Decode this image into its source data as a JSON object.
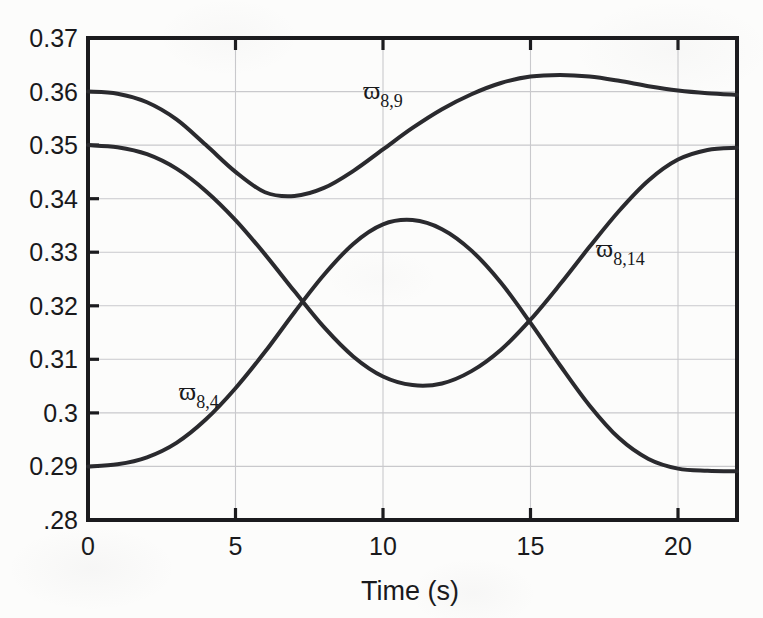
{
  "chart_data": {
    "type": "line",
    "title": "",
    "xlabel": "Time (s)",
    "ylabel": "",
    "xlim": [
      0,
      22
    ],
    "ylim": [
      0.28,
      0.37
    ],
    "grid": true,
    "legend_position": "inline-annotations",
    "x_ticks": [
      0,
      5,
      10,
      15,
      20
    ],
    "x_tick_labels": [
      "0",
      "5",
      "10",
      "15",
      "20"
    ],
    "y_ticks": [
      0.28,
      0.29,
      0.3,
      0.31,
      0.32,
      0.33,
      0.34,
      0.35,
      0.36,
      0.37
    ],
    "y_tick_labels": [
      ".28",
      "0.29",
      "0.3",
      "0.31",
      "0.32",
      "0.33",
      "0.34",
      "0.35",
      "0.36",
      "0.37"
    ],
    "x": [
      0,
      1,
      2,
      3,
      4,
      5,
      6,
      7,
      8,
      9,
      10,
      11,
      12,
      13,
      14,
      15,
      16,
      17,
      18,
      19,
      20,
      21,
      22
    ],
    "series": [
      {
        "name": "w_8,9",
        "label_base": "ϖ",
        "label_sub": "8,9",
        "color": "#2a2a2e",
        "values": [
          0.36,
          0.3596,
          0.358,
          0.3548,
          0.35,
          0.345,
          0.3412,
          0.3405,
          0.342,
          0.3452,
          0.3492,
          0.3532,
          0.3567,
          0.3595,
          0.3616,
          0.3628,
          0.3631,
          0.3628,
          0.362,
          0.361,
          0.3602,
          0.3597,
          0.3594
        ]
      },
      {
        "name": "w_8,14",
        "label_base": "ϖ",
        "label_sub": "8,14",
        "color": "#2a2a2e",
        "values": [
          0.35,
          0.3496,
          0.3483,
          0.3456,
          0.3414,
          0.336,
          0.3296,
          0.3227,
          0.316,
          0.3105,
          0.3068,
          0.3052,
          0.3055,
          0.3078,
          0.3118,
          0.3174,
          0.324,
          0.331,
          0.3377,
          0.3434,
          0.3473,
          0.3491,
          0.3495
        ]
      },
      {
        "name": "w_8,4",
        "label_base": "ϖ",
        "label_sub": "8,4",
        "color": "#2a2a2e",
        "values": [
          0.29,
          0.2904,
          0.2917,
          0.2944,
          0.2988,
          0.3046,
          0.3114,
          0.3188,
          0.3258,
          0.3316,
          0.3352,
          0.336,
          0.3343,
          0.3303,
          0.3243,
          0.3168,
          0.3089,
          0.3014,
          0.2953,
          0.2914,
          0.2896,
          0.2892,
          0.2891
        ]
      }
    ],
    "annotations": [
      {
        "text_base": "ϖ",
        "text_sub": "8,9",
        "x": 10.0,
        "y": 0.3595
      },
      {
        "text_base": "ϖ",
        "text_sub": "8,14",
        "x": 18.0,
        "y": 0.3295
      },
      {
        "text_base": "ϖ",
        "text_sub": "8,4",
        "x": 3.6,
        "y": 0.3022
      }
    ]
  },
  "axes": {
    "x_title": "Time (s)",
    "x_tick_labels": [
      "0",
      "5",
      "10",
      "15",
      "20"
    ],
    "y_tick_labels": [
      ".28",
      "0.29",
      "0.3",
      "0.31",
      "0.32",
      "0.33",
      "0.34",
      "0.35",
      "0.36",
      "0.37"
    ]
  },
  "labels": {
    "w89_base": "ϖ",
    "w89_sub": "8,9",
    "w814_base": "ϖ",
    "w814_sub": "8,14",
    "w84_base": "ϖ",
    "w84_sub": "8,4"
  },
  "colors": {
    "curve": "#2a2a2e",
    "grid": "#c9c9cc",
    "frame": "#1b1b1e",
    "background": "#fcfcfb",
    "text": "#19191c"
  }
}
